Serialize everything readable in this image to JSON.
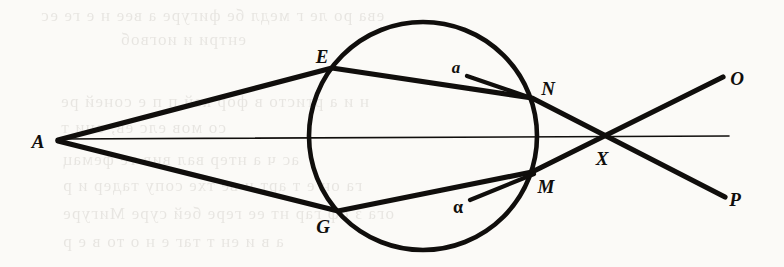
{
  "figure": {
    "background_color": "#fbfaf7",
    "ink_color": "#100e0c",
    "width": 784,
    "height": 267
  },
  "labels": {
    "A": "A",
    "E": "E",
    "G": "G",
    "N": "N",
    "M": "M",
    "X": "X",
    "O": "O",
    "P": "P",
    "a_upper": "a",
    "alpha_lower": "α"
  },
  "label_positions": {
    "A": {
      "x": 38,
      "y": 141
    },
    "E": {
      "x": 322,
      "y": 56
    },
    "G": {
      "x": 323,
      "y": 226
    },
    "N": {
      "x": 548,
      "y": 88
    },
    "M": {
      "x": 546,
      "y": 186
    },
    "X": {
      "x": 602,
      "y": 158
    },
    "O": {
      "x": 737,
      "y": 78
    },
    "P": {
      "x": 735,
      "y": 199
    },
    "a_upper": {
      "x": 456,
      "y": 67
    },
    "alpha_lower": {
      "x": 458,
      "y": 207
    }
  },
  "geometry": {
    "circle": {
      "cx": 423,
      "cy": 136,
      "r": 114,
      "stroke_width": 4.6
    },
    "axis": {
      "x1": 58,
      "y1": 139,
      "x2": 729,
      "y2": 136,
      "stroke_width": 1.6
    },
    "rays": [
      {
        "name": "A-E-N-P",
        "points": "58,140 332,68 532,98 725,197",
        "stroke_width": 5.2
      },
      {
        "name": "A-G-M-O",
        "points": "58,141 338,211 532,172 723,77",
        "stroke_width": 5.2
      }
    ],
    "normals": [
      {
        "name": "a-to-N",
        "x1": 467,
        "y1": 76,
        "x2": 534,
        "y2": 99,
        "stroke_width": 4.2
      },
      {
        "name": "alpha-to-M",
        "x1": 470,
        "y1": 200,
        "x2": 534,
        "y2": 174,
        "stroke_width": 4.2
      }
    ]
  },
  "bleed_through_text": [
    {
      "text": "ева ро ле г медл бе фигуре а вее н е ге ес",
      "x": 40,
      "y": 6
    },
    {
      "text": "ентри и иогвоб",
      "x": 120,
      "y": 30
    },
    {
      "text": "н и а ртисто в фор кей п п е соней ре",
      "x": 60,
      "y": 92
    },
    {
      "text": "со мов елс ев, они т",
      "x": 60,
      "y": 118
    },
    {
      "text": "ас ч а нтер вал вив те фемац",
      "x": 62,
      "y": 150
    },
    {
      "text": "га он е т арт и ве тхе сопу тадер и р",
      "x": 62,
      "y": 176
    },
    {
      "text": "ога з оф гар нт ее гере бей суре Мигуре",
      "x": 62,
      "y": 204
    },
    {
      "text": "а в и ен т таг е н о то в е р",
      "x": 62,
      "y": 232
    }
  ]
}
